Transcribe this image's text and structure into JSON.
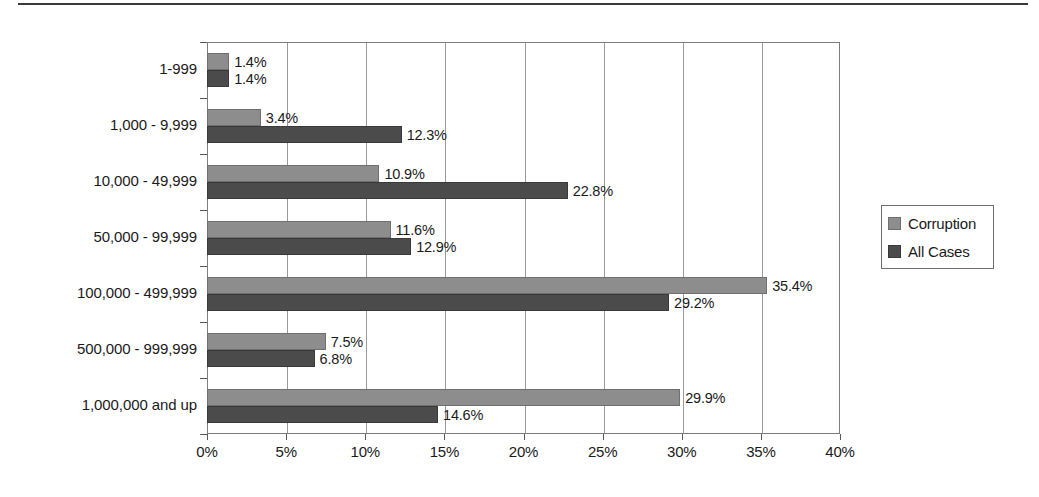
{
  "chart_data": {
    "type": "bar",
    "orientation": "horizontal",
    "title": "",
    "xlabel": "",
    "ylabel": "",
    "xlim": [
      0,
      40
    ],
    "xtick_labels": [
      "0%",
      "5%",
      "10%",
      "15%",
      "20%",
      "25%",
      "30%",
      "35%",
      "40%"
    ],
    "xtick_values": [
      0,
      5,
      10,
      15,
      20,
      25,
      30,
      35,
      40
    ],
    "grid": "vertical",
    "categories": [
      "1-999",
      "1,000 - 9,999",
      "10,000 - 49,999",
      "50,000 - 99,999",
      "100,000 - 499,999",
      "500,000 - 999,999",
      "1,000,000 and up"
    ],
    "series": [
      {
        "name": "Corruption",
        "color": "#8d8d8d",
        "values": [
          1.4,
          3.4,
          10.9,
          11.6,
          35.4,
          7.5,
          29.9
        ],
        "labels": [
          "1.4%",
          "3.4%",
          "10.9%",
          "11.6%",
          "35.4%",
          "7.5%",
          "29.9%"
        ]
      },
      {
        "name": "All Cases",
        "color": "#4b4b4b",
        "values": [
          1.4,
          12.3,
          22.8,
          12.9,
          29.2,
          6.8,
          14.6
        ],
        "labels": [
          "1.4%",
          "12.3%",
          "22.8%",
          "12.9%",
          "29.2%",
          "6.8%",
          "14.6%"
        ]
      }
    ],
    "legend": {
      "position": "right",
      "entries": [
        {
          "label": "Corruption",
          "color": "#8d8d8d"
        },
        {
          "label": "All Cases",
          "color": "#4b4b4b"
        }
      ]
    }
  }
}
